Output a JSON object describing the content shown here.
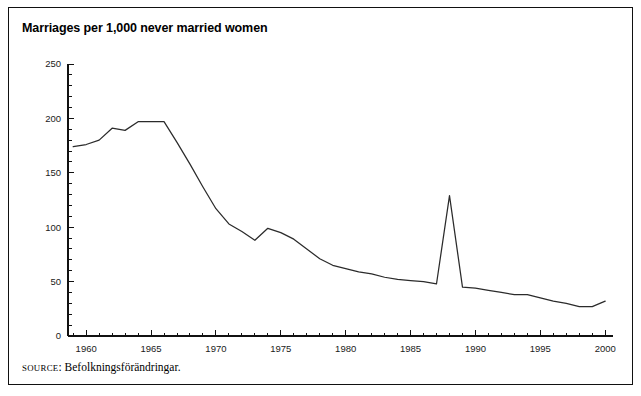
{
  "figure": {
    "title": "Marriages per 1,000 never married women",
    "source_prefix": "SOURCE",
    "source_separator": ":",
    "source_text": " Befolkningsförändringar.",
    "line_color": "#2b2b2b",
    "axis_color": "#111111",
    "background": "#ffffff"
  },
  "chart_data": {
    "type": "line",
    "title": "Marriages per 1,000 never married women",
    "xlabel": "",
    "ylabel": "",
    "xlim": [
      1958.6,
      2000.6
    ],
    "ylim": [
      0,
      250
    ],
    "grid": false,
    "legend": false,
    "y_ticks_major": [
      0,
      50,
      100,
      150,
      200,
      250
    ],
    "y_tick_labels": [
      "0",
      "50",
      "100",
      "150",
      "200",
      "250"
    ],
    "y_tick_minor_step": 10,
    "x_ticks_major": [
      1960,
      1965,
      1970,
      1975,
      1980,
      1985,
      1990,
      1995,
      2000
    ],
    "x_tick_labels": [
      "1960",
      "1965",
      "1970",
      "1975",
      "1980",
      "1985",
      "1990",
      "1995",
      "2000"
    ],
    "x_tick_minor_step": 1,
    "series": [
      {
        "name": "Marriages per 1,000 never married women",
        "color": "#2b2b2b",
        "x": [
          1959,
          1960,
          1961,
          1962,
          1963,
          1964,
          1965,
          1966,
          1967,
          1968,
          1969,
          1970,
          1971,
          1972,
          1973,
          1974,
          1975,
          1976,
          1977,
          1978,
          1979,
          1980,
          1981,
          1982,
          1983,
          1984,
          1985,
          1986,
          1987,
          1988,
          1989,
          1990,
          1991,
          1992,
          1993,
          1994,
          1995,
          1996,
          1997,
          1998,
          1999,
          2000
        ],
        "values": [
          174,
          176,
          180,
          191,
          189,
          197,
          197,
          197,
          178,
          158,
          137,
          117,
          103,
          96,
          88,
          99,
          95,
          89,
          80,
          71,
          65,
          62,
          59,
          57,
          54,
          52,
          51,
          50,
          48,
          129,
          45,
          44,
          42,
          40,
          38,
          38,
          35,
          32,
          30,
          27,
          27,
          32
        ]
      }
    ],
    "annotations": [
      {
        "label": "1988 marriage-law spike",
        "x": 1988,
        "y": 129
      }
    ]
  }
}
